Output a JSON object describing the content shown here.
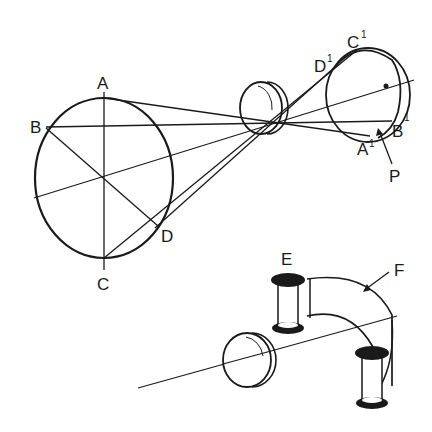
{
  "figure": {
    "type": "optics-diagram",
    "colors": {
      "stroke": "#1a1a1a",
      "background": "#ffffff"
    }
  },
  "labels": {
    "A": "A",
    "B": "B",
    "C": "C",
    "D": "D",
    "A1": "A",
    "A1_sup": "1",
    "B1": "B",
    "B1_sup": "1",
    "C1": "C",
    "C1_sup": "1",
    "D1": "D",
    "D1_sup": "1",
    "P": "P",
    "E": "E",
    "F": "F"
  }
}
